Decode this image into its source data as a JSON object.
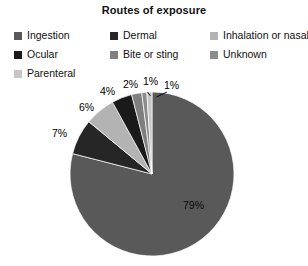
{
  "chart": {
    "title": "Routes of exposure"
  },
  "legend": {
    "items": [
      {
        "label": "Ingestion",
        "color": "#595959"
      },
      {
        "label": "Dermal",
        "color": "#262626"
      },
      {
        "label": "Inhalation or nasal",
        "color": "#b3b3b3"
      },
      {
        "label": "Ocular",
        "color": "#1a1a1a"
      },
      {
        "label": "Bite or sting",
        "color": "#7f7f7f"
      },
      {
        "label": "Unknown",
        "color": "#8c8c8c"
      },
      {
        "label": "Parenteral",
        "color": "#c6c6c6"
      }
    ]
  },
  "labels": {
    "ingestion_pct": "79%",
    "dermal_pct": "7%",
    "inhalation_pct": "6%",
    "ocular_pct": "4%",
    "bite_pct": "2%",
    "unknown_pct": "1%",
    "parenteral_pct": "1%"
  },
  "chart_data": {
    "type": "pie",
    "title": "Routes of exposure",
    "categories": [
      "Ingestion",
      "Dermal",
      "Inhalation or nasal",
      "Ocular",
      "Bite or sting",
      "Unknown",
      "Parenteral"
    ],
    "values": [
      79,
      7,
      6,
      4,
      2,
      1,
      1
    ],
    "value_labels": [
      "79%",
      "7%",
      "6%",
      "4%",
      "2%",
      "1%",
      "1%"
    ],
    "unit": "percent",
    "colors": [
      "#595959",
      "#262626",
      "#b3b3b3",
      "#1a1a1a",
      "#7f7f7f",
      "#8c8c8c",
      "#c6c6c6"
    ],
    "legend_position": "top",
    "start_angle_deg": 0,
    "direction": "clockwise",
    "grid": false,
    "xlabel": "",
    "ylabel": ""
  }
}
